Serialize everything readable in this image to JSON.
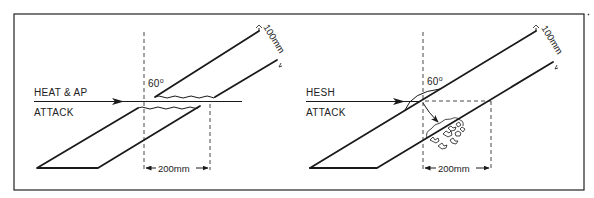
{
  "figure": {
    "panels": [
      {
        "id": "heat-ap",
        "attack_label_line1": "HEAT & AP",
        "attack_label_line2": "ATTACK",
        "angle_label": "60",
        "angle_unit": "o",
        "thickness_label": "100mm",
        "path_length_label": "200mm"
      },
      {
        "id": "hesh",
        "attack_label_line1": "HESH",
        "attack_label_line2": "ATTACK",
        "angle_label": "60",
        "angle_unit": "o",
        "thickness_label": "100mm",
        "path_length_label": "200mm"
      }
    ]
  },
  "colors": {
    "ink": "#1a1a1a",
    "background": "#ffffff"
  }
}
